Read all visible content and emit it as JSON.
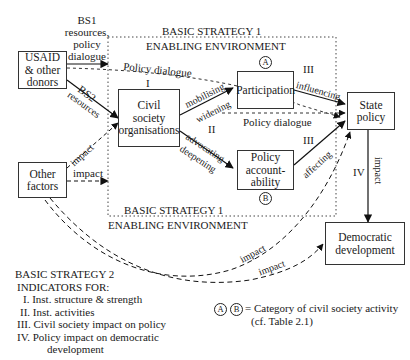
{
  "boxes": {
    "donors": "USAID & other donors",
    "donors_lines": [
      "USAID",
      "& other",
      "donors"
    ],
    "cso": [
      "Civil",
      "society",
      "organisations"
    ],
    "participation": "Participation",
    "accountability": [
      "Policy",
      "account-",
      "ability"
    ],
    "state_policy": [
      "State",
      "policy"
    ],
    "other_factors": [
      "Other",
      "factors"
    ],
    "democratic": [
      "Democratic",
      "development"
    ]
  },
  "region": {
    "top_title": "BASIC STRATEGY 1",
    "top_subtitle": "ENABLING ENVIRONMENT",
    "bottom_title": "BASIC STRATEGY 1",
    "bottom_subtitle": "ENABLING ENVIRONMENT"
  },
  "edge_labels": {
    "bs1": [
      "BS1",
      "resources,",
      "policy",
      "dialogue"
    ],
    "policy_dialogue_top": "Policy dialogue",
    "bs2": "BS2",
    "resources": "resources",
    "roman_I": "I",
    "roman_II": "II",
    "roman_III_top": "III",
    "roman_III_bottom": "III",
    "roman_IV": "IV",
    "mobilising": "mobilising",
    "widening": "widening",
    "advocating": "advocating",
    "deepening": "deepening",
    "influencing": "influencing",
    "policy_dialogue_mid": "Policy dialogue",
    "affecting": "affecting",
    "impact_vertical": "impact",
    "impact_other_up": "impact",
    "impact_other_right": "impact",
    "impact_curve_1": "impact",
    "impact_curve_2": "impact"
  },
  "markers": {
    "A": "A",
    "B": "B"
  },
  "legend": {
    "title": "BASIC STRATEGY 2",
    "subtitle": "INDICATORS FOR:",
    "items": [
      "I. Inst. structure & strength",
      "II. Inst. activities",
      "III. Civil society impact on policy",
      "IV. Policy impact on democratic",
      "development"
    ],
    "category_note": "= Category of civil society activity",
    "category_ref": "(cf. Table 2.1)"
  }
}
